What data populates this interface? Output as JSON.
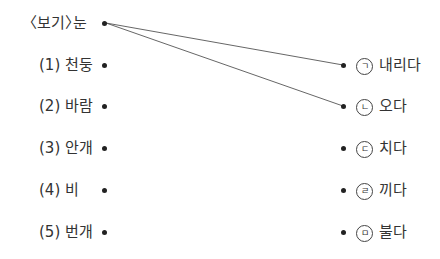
{
  "example": {
    "prefix": "〈보기〉",
    "word": "눈"
  },
  "left_items": [
    {
      "num": "(1)",
      "word": "천둥"
    },
    {
      "num": "(2)",
      "word": "바람"
    },
    {
      "num": "(3)",
      "word": "안개"
    },
    {
      "num": "(4)",
      "word": "비"
    },
    {
      "num": "(5)",
      "word": "번개"
    }
  ],
  "right_items": [
    {
      "mark": "ㄱ",
      "word": "내리다"
    },
    {
      "mark": "ㄴ",
      "word": "오다"
    },
    {
      "mark": "ㄷ",
      "word": "치다"
    },
    {
      "mark": "ㄹ",
      "word": "끼다"
    },
    {
      "mark": "ㅁ",
      "word": "불다"
    }
  ],
  "connections": [
    {
      "from": "example",
      "to": "ㄱ"
    },
    {
      "from": "example",
      "to": "ㄴ"
    }
  ]
}
